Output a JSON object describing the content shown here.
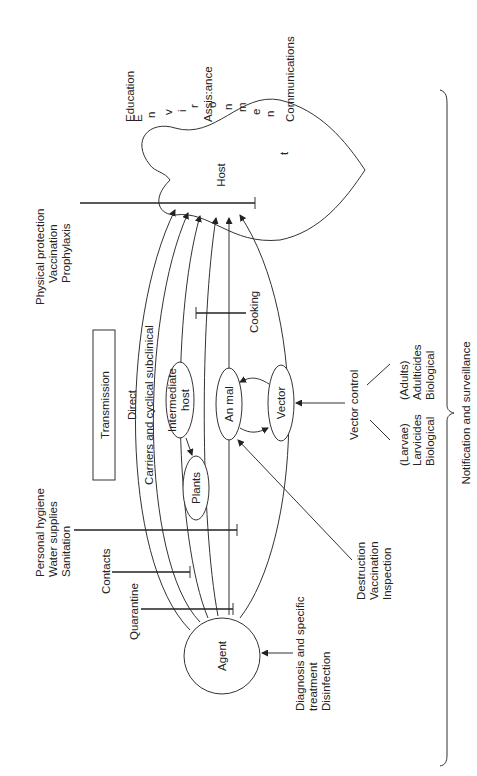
{
  "diagram": {
    "orientation": "rotated 90° counter-clockwise",
    "nodes": {
      "agent": "Agent",
      "host": "Host",
      "intermediate_host": "Intermediate host",
      "plants": "Plants",
      "animal": "An mal",
      "vector": "Vector",
      "transmission_box": "Transmission"
    },
    "path_labels": {
      "direct": "Direct",
      "carriers": "Carriers and cyclical subclinical"
    },
    "environment_letters": [
      "E",
      "n",
      "v",
      "i",
      "r",
      "o",
      "n",
      "m",
      "e",
      "n",
      "t"
    ],
    "interventions": {
      "education": "Education",
      "assistance": "Assis:ance",
      "communications": "Communications",
      "physical_protection": [
        "Physical protection",
        "Vaccination",
        "Prophylaxis"
      ],
      "cooking": "Cooking",
      "vector_control": "Vector control",
      "adults": [
        "(Adults)",
        "Adulticides",
        "Biological"
      ],
      "larvae": [
        "(Larvae)",
        "Larvicides",
        "Biological"
      ],
      "personal_hygiene": [
        "Personal hygiene",
        "Water supplies",
        "Sanitation"
      ],
      "contacts": "Contacts",
      "quarantine": "Quarantine",
      "animal_measures": [
        "Destruction",
        "Vaccination",
        "Inspection"
      ],
      "agent_measures": [
        "Diagnosis and specific",
        "treatment",
        "Disinfection"
      ],
      "notification": "Notification and surveillance"
    }
  }
}
